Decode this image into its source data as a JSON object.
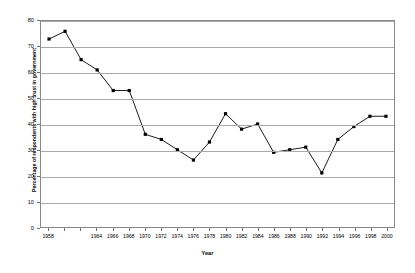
{
  "chart_data": {
    "type": "line",
    "title": "",
    "xlabel": "Year",
    "ylabel": "Percentage of respondents with high trust in government",
    "xlim": [
      1957,
      2001
    ],
    "ylim": [
      0,
      80
    ],
    "ytick_labels": [
      "0",
      "10",
      "20",
      "30",
      "40",
      "50",
      "60",
      "70",
      "80"
    ],
    "ytick_values": [
      0,
      10,
      20,
      30,
      40,
      50,
      60,
      70,
      80
    ],
    "grid": true,
    "legend": false,
    "marker": "square",
    "line_color": "#000000",
    "marker_color": "#000000",
    "gridline_color": "#a9a9a9",
    "frame_color": "#8a8a8a",
    "x": [
      1958,
      1960,
      1962,
      1964,
      1966,
      1968,
      1970,
      1972,
      1974,
      1976,
      1978,
      1980,
      1982,
      1984,
      1986,
      1988,
      1990,
      1992,
      1994,
      1996,
      1998,
      2000
    ],
    "xtick_labels": [
      "1958",
      "1960",
      "1962",
      "1964",
      "1966",
      "1968",
      "1970",
      "1972",
      "1974",
      "1976",
      "1978",
      "1980",
      "1982",
      "1984",
      "1986",
      "1988",
      "1990",
      "1992",
      "1994",
      "1996",
      "1998",
      "2000"
    ],
    "xtick_shown": [
      1958,
      1964,
      1966,
      1968,
      1970,
      1972,
      1974,
      1976,
      1978,
      1980,
      1982,
      1984,
      1986,
      1988,
      1990,
      1992,
      1994,
      1996,
      1998,
      2000
    ],
    "values": [
      73,
      76,
      65,
      61,
      53,
      53,
      36,
      34,
      30,
      26,
      33,
      44,
      38,
      40,
      29,
      30,
      31,
      21,
      34,
      39,
      43,
      43
    ],
    "series": [
      {
        "name": "Percentage of respondents with high trust in government",
        "values": [
          73,
          76,
          65,
          61,
          53,
          53,
          36,
          34,
          30,
          26,
          33,
          44,
          38,
          40,
          29,
          30,
          31,
          21,
          34,
          39,
          43,
          43
        ]
      }
    ]
  }
}
